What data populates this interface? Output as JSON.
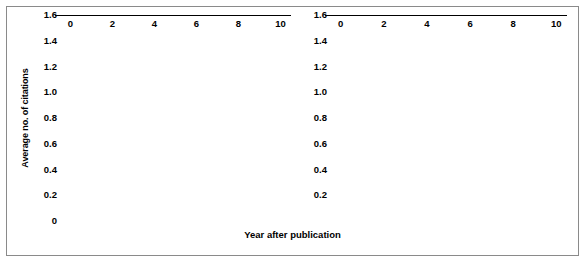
{
  "figure": {
    "x_axis_title": "Year after publication",
    "y_axis_title": "Average no. of citations",
    "bar_color": "#1c1c1c",
    "axis_color": "#000000",
    "background_color": "#ffffff",
    "border_color": "#8a8a8a"
  },
  "chart_data": [
    {
      "type": "bar",
      "title": "",
      "xlabel": "Year after publication",
      "ylabel": "Average no. of citations",
      "categories": [
        0,
        1,
        2,
        3,
        4,
        5,
        6,
        7,
        8,
        9,
        10
      ],
      "values": [
        0.08,
        0.65,
        0.94,
        0.87,
        0.76,
        0.73,
        0.67,
        0.53,
        0.48,
        0.33,
        0.37
      ],
      "xlim": [
        -0.5,
        10.5
      ],
      "ylim": [
        0,
        1.6
      ],
      "ytick_labels": [
        "0",
        "0.2",
        "0.4",
        "0.6",
        "0.8",
        "1.0",
        "1.2",
        "1.4",
        "1.6"
      ],
      "ytick_values": [
        0,
        0.2,
        0.4,
        0.6,
        0.8,
        1.0,
        1.2,
        1.4,
        1.6
      ],
      "xtick_labels": [
        "0",
        "2",
        "4",
        "6",
        "8",
        "10"
      ],
      "xtick_values": [
        0,
        2,
        4,
        6,
        8,
        10
      ],
      "grid": false,
      "legend": "none"
    },
    {
      "type": "bar",
      "title": "",
      "xlabel": "Year after publication",
      "ylabel": "",
      "categories": [
        0,
        1,
        2,
        3,
        4,
        5,
        6,
        7,
        8,
        9,
        10
      ],
      "values": [
        0.31,
        0.74,
        1.35,
        1.55,
        1.29,
        1.25,
        1.02,
        0.97,
        1.21,
        1.09,
        1.17
      ],
      "xlim": [
        -0.5,
        10.5
      ],
      "ylim": [
        0,
        1.6
      ],
      "ytick_labels": [
        "",
        "0.2",
        "0.4",
        "0.6",
        "0.8",
        "1.0",
        "1.2",
        "1.4",
        "1.6"
      ],
      "ytick_values": [
        0,
        0.2,
        0.4,
        0.6,
        0.8,
        1.0,
        1.2,
        1.4,
        1.6
      ],
      "xtick_labels": [
        "0",
        "2",
        "4",
        "6",
        "8",
        "10"
      ],
      "xtick_values": [
        0,
        2,
        4,
        6,
        8,
        10
      ],
      "grid": false,
      "legend": "none"
    }
  ]
}
